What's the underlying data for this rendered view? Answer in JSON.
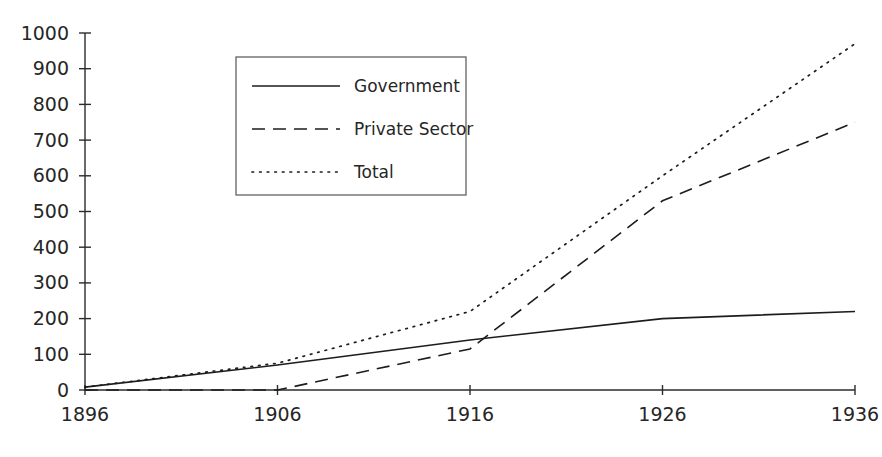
{
  "chart_data": {
    "type": "line",
    "title": "",
    "subtitle": "",
    "xlabel": "",
    "ylabel": "",
    "x": [
      1896,
      1906,
      1916,
      1926,
      1936
    ],
    "categories": [
      "1896",
      "1906",
      "1916",
      "1926",
      "1936"
    ],
    "xlim": [
      1896,
      1936
    ],
    "ylim": [
      0,
      1000
    ],
    "ytick_labels": [
      "0",
      "100",
      "200",
      "300",
      "400",
      "500",
      "600",
      "700",
      "800",
      "900",
      "1000"
    ],
    "ytick_values": [
      0,
      100,
      200,
      300,
      400,
      500,
      600,
      700,
      800,
      900,
      1000
    ],
    "xtick_labels": [
      "1896",
      "1906",
      "1916",
      "1926",
      "1936"
    ],
    "grid": false,
    "legend_position": "upper-left-inset",
    "series": [
      {
        "name": "Government",
        "style": "solid",
        "color": "#1c1c1c",
        "values": [
          8,
          70,
          140,
          200,
          220
        ]
      },
      {
        "name": "Private Sector",
        "style": "dashed",
        "color": "#1c1c1c",
        "values": [
          0,
          0,
          115,
          530,
          750
        ]
      },
      {
        "name": "Total",
        "style": "dotted",
        "color": "#1c1c1c",
        "values": [
          8,
          75,
          220,
          600,
          970
        ]
      }
    ]
  },
  "legend": {
    "entries": [
      {
        "label": "Government",
        "style": "solid"
      },
      {
        "label": "Private Sector",
        "style": "dashed"
      },
      {
        "label": "Total",
        "style": "dotted"
      }
    ]
  }
}
